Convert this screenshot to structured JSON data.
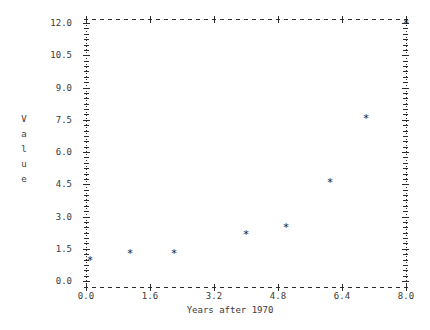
{
  "chart_data": {
    "type": "scatter",
    "title": "",
    "xlabel": "Years after 1970",
    "ylabel": "Value",
    "ylabel_chars": [
      "V",
      "a",
      "l",
      "u",
      "e"
    ],
    "xlim": [
      0.0,
      8.0
    ],
    "ylim": [
      0.0,
      12.0
    ],
    "xticks": [
      "0.0",
      "1.6",
      "3.2",
      "4.8",
      "6.4",
      "8.0"
    ],
    "xtick_values": [
      0.0,
      1.6,
      3.2,
      4.8,
      6.4,
      8.0
    ],
    "yticks": [
      "0.0",
      "1.5",
      "3.0",
      "4.5",
      "6.0",
      "7.5",
      "9.0",
      "10.5",
      "12.0"
    ],
    "ytick_values": [
      0.0,
      1.5,
      3.0,
      4.5,
      6.0,
      7.5,
      9.0,
      10.5,
      12.0
    ],
    "grid": false,
    "legend": null,
    "marker_glyph": "*",
    "marker_color": "#151515",
    "axis_color": "#2b2b2b",
    "background_color": "#ffffff",
    "x": [
      0.1,
      1.1,
      2.2,
      4.0,
      5.0,
      6.1,
      7.0,
      8.0
    ],
    "y": [
      1.0,
      1.3,
      1.3,
      2.2,
      2.5,
      4.6,
      7.6,
      12.0
    ],
    "points": [
      {
        "x": 0.1,
        "y": 1.0
      },
      {
        "x": 1.1,
        "y": 1.3
      },
      {
        "x": 2.2,
        "y": 1.3
      },
      {
        "x": 4.0,
        "y": 2.2
      },
      {
        "x": 5.0,
        "y": 2.5
      },
      {
        "x": 6.1,
        "y": 4.6
      },
      {
        "x": 7.0,
        "y": 7.6
      },
      {
        "x": 8.0,
        "y": 12.0
      }
    ]
  }
}
